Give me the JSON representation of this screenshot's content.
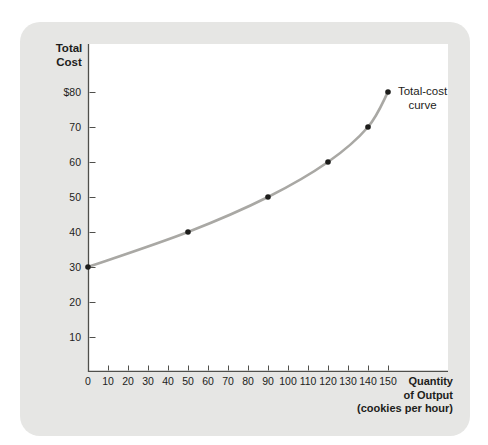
{
  "labels": {
    "y_title_line1": "Total",
    "y_title_line2": "Cost",
    "x_title_line1": "Quantity",
    "x_title_line2": "of Output",
    "x_title_line3": "(cookies per hour)",
    "curve_label_line1": "Total-cost",
    "curve_label_line2": "curve"
  },
  "chart_data": {
    "type": "line",
    "title": "",
    "xlabel": "Quantity of Output (cookies per hour)",
    "ylabel": "Total Cost",
    "series": [
      {
        "name": "Total-cost curve",
        "points": [
          [
            0,
            30
          ],
          [
            50,
            40
          ],
          [
            90,
            50
          ],
          [
            120,
            60
          ],
          [
            140,
            70
          ],
          [
            150,
            80
          ]
        ]
      }
    ],
    "x_ticks": [
      0,
      10,
      20,
      30,
      40,
      50,
      60,
      70,
      80,
      90,
      100,
      110,
      120,
      130,
      140,
      150
    ],
    "x_tick_labels": [
      "0",
      "10",
      "20",
      "30",
      "40",
      "50",
      "60",
      "70",
      "80",
      "90",
      "100",
      "110",
      "120",
      "130",
      "140",
      "150"
    ],
    "y_ticks": [
      10,
      20,
      30,
      40,
      50,
      60,
      70,
      80
    ],
    "y_tick_labels": [
      "10",
      "20",
      "30",
      "40",
      "50",
      "60",
      "70",
      "$80"
    ],
    "xlim": [
      0,
      160
    ],
    "ylim": [
      0,
      85
    ],
    "grid": false,
    "legend": "annotation",
    "annotation": "Total-cost curve",
    "colors": {
      "curve": "#a9a8a4",
      "point": "#1d1d1b",
      "axis": "#4f4f4b",
      "tick": "#4f4f4b",
      "text": "#1d1d1b",
      "plot_bg": "#ffffff",
      "card_bg": "#e6e6e4",
      "page_bg": "#ffffff"
    }
  }
}
